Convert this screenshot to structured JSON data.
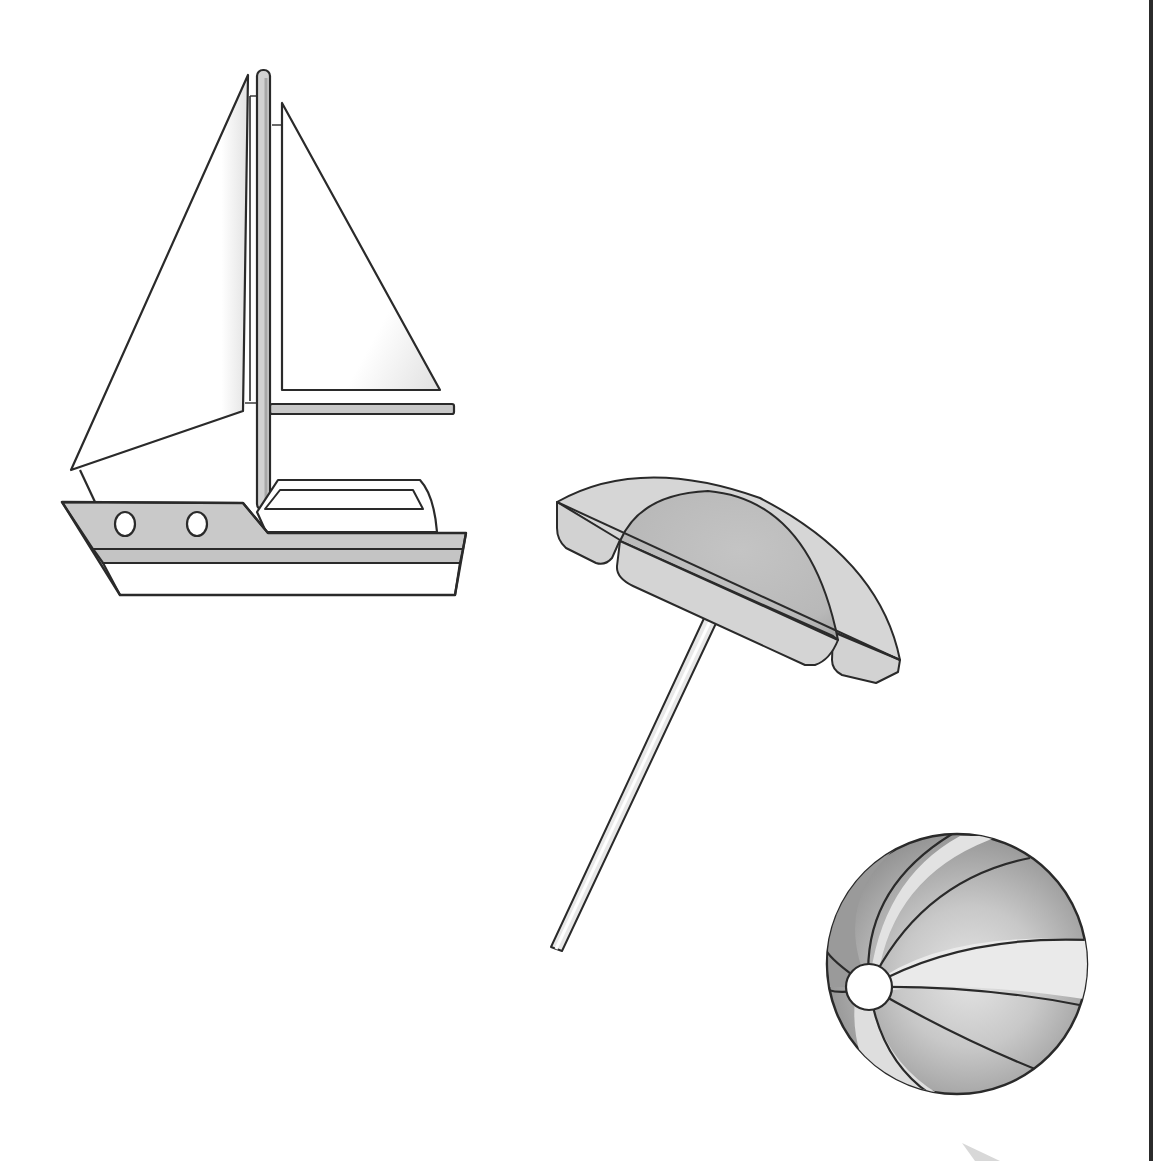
{
  "scene": {
    "description": "Beach-themed clip art illustrations on a white page",
    "background": "#ffffff",
    "border_color": "#2b2b2b",
    "line_color": "#2a2a2a",
    "objects": [
      {
        "name": "sailboat",
        "label": "Sailboat"
      },
      {
        "name": "beach-umbrella",
        "label": "Beach umbrella"
      },
      {
        "name": "beach-ball",
        "label": "Beach ball"
      }
    ]
  },
  "colors": {
    "hull_gray": "#c9c9c9",
    "sail_white": "#ffffff",
    "sail_shade": "#e6e6e6",
    "umbrella_light": "#d6d6d6",
    "umbrella_mid": "#bdbdbd",
    "ball_dark": "#8a8a8a",
    "ball_mid": "#b0b0b0",
    "ball_light": "#dcdcdc"
  }
}
